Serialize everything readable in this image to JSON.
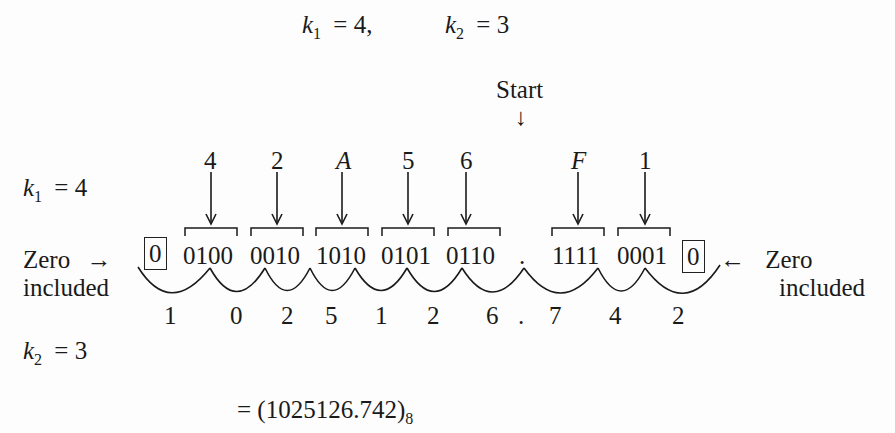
{
  "header": {
    "k1_label": "k",
    "k1_sub": "1",
    "k1_eq": "= 4,",
    "k2_label": "k",
    "k2_sub": "2",
    "k2_eq": "= 3"
  },
  "start_label": "Start",
  "start_arrow": "↓",
  "left_rows": {
    "k1": {
      "label": "k",
      "sub": "1",
      "eq": "= 4"
    },
    "k2": {
      "label": "k",
      "sub": "2",
      "eq": "= 3"
    }
  },
  "hex_digits": [
    {
      "text": "4",
      "x": 210,
      "italic": false
    },
    {
      "text": "2",
      "x": 277,
      "italic": false
    },
    {
      "text": "A",
      "x": 342,
      "italic": true
    },
    {
      "text": "5",
      "x": 408,
      "italic": false
    },
    {
      "text": "6",
      "x": 466,
      "italic": false
    },
    {
      "text": "F",
      "x": 577,
      "italic": true
    },
    {
      "text": "1",
      "x": 645,
      "italic": false
    }
  ],
  "binary_groups": [
    {
      "text": "0100",
      "x": 183
    },
    {
      "text": "0010",
      "x": 250
    },
    {
      "text": "1010",
      "x": 316
    },
    {
      "text": "0101",
      "x": 381
    },
    {
      "text": "0110",
      "x": 446
    },
    {
      "text": "1111",
      "x": 552
    },
    {
      "text": "0001",
      "x": 617
    }
  ],
  "radix_point": ".",
  "left_zero": {
    "value": "0",
    "note_line1": "Zero",
    "note_line2": "included",
    "arrow": "→"
  },
  "right_zero": {
    "value": "0",
    "note_line1": "Zero",
    "note_line2": "included",
    "arrow": "←"
  },
  "octal_digits": [
    {
      "text": "1",
      "x": 170
    },
    {
      "text": "0",
      "x": 236
    },
    {
      "text": "2",
      "x": 287
    },
    {
      "text": "5",
      "x": 331
    },
    {
      "text": "1",
      "x": 381
    },
    {
      "text": "2",
      "x": 433
    },
    {
      "text": "6",
      "x": 492
    },
    {
      "text": ".",
      "x": 524
    },
    {
      "text": "7",
      "x": 555
    },
    {
      "text": "4",
      "x": 615
    },
    {
      "text": "2",
      "x": 678
    }
  ],
  "result": {
    "prefix": "= (1025126.742)",
    "base": "8"
  }
}
